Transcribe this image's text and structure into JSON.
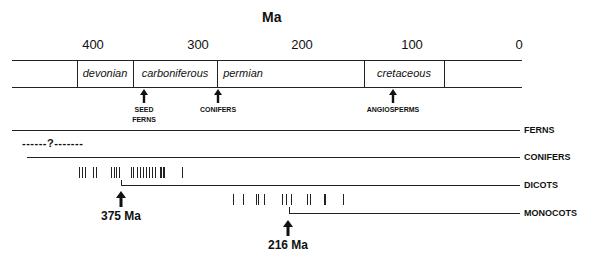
{
  "axis": {
    "title": "Ma",
    "ticks": [
      "400",
      "300",
      "200",
      "100",
      "0"
    ]
  },
  "periods": [
    "devonian",
    "carboniferous",
    "permian",
    "cretaceous"
  ],
  "annotations": {
    "seed_ferns": "SEED FERNS",
    "seed_ferns_line1": "SEED",
    "seed_ferns_line2": "FERNS",
    "conifers": "CONIFERS",
    "angiosperms": "ANGIOSPERMS"
  },
  "lineages": {
    "ferns": "FERNS",
    "conifers": "CONIFERS",
    "dicots": "DICOTS",
    "monocots": "MONOCOTS"
  },
  "uncertain_marker": "------?-------",
  "divergence_labels": {
    "dicots": "375 Ma",
    "monocots": "216 Ma"
  },
  "colors": {
    "line": "#222222",
    "background": "#ffffff"
  }
}
